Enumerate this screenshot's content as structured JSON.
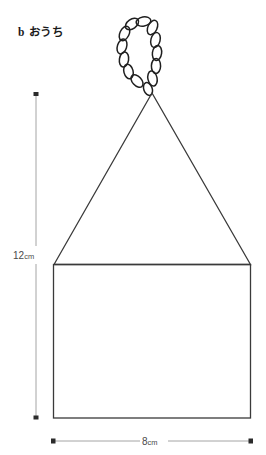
{
  "figure": {
    "label": "b",
    "title": "おうち",
    "full_title": "b おうち"
  },
  "dimensions": {
    "height": {
      "value": "12",
      "unit": "cm",
      "text": "12cm",
      "orientation": "vertical"
    },
    "width": {
      "value": "8",
      "unit": "cm",
      "text": "8cm",
      "orientation": "horizontal"
    }
  },
  "shape": {
    "name": "house",
    "parts": [
      "chain-loop-hanger",
      "triangle-roof",
      "square-body"
    ]
  },
  "colors": {
    "outline": "#3a3a3a",
    "chain": "#1f1f1f",
    "dimension_line": "#8c8c8c",
    "dimension_text": "#4a4a4a",
    "background": "#ffffff"
  }
}
